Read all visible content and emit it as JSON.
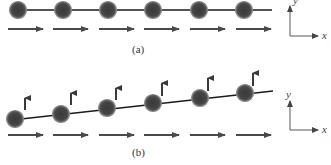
{
  "panels": [
    {
      "id": "a",
      "caption": "(a)",
      "description": "Particles in a row moving uniformly in +x direction",
      "axes": {
        "x_label": "x",
        "y_label": "y"
      },
      "particle_count": 6
    },
    {
      "id": "b",
      "caption": "(b)",
      "description": "Particles along a tilted line, each with velocity in +x and a small +y component",
      "axes": {
        "x_label": "x",
        "y_label": "y"
      },
      "particle_count": 6
    }
  ],
  "colors": {
    "ball_fill": "#3e3e3e",
    "ball_rim": "#8a8a8a",
    "line": "#1a1a1a",
    "arrow": "#4a4a4a",
    "axis": "#555555"
  }
}
